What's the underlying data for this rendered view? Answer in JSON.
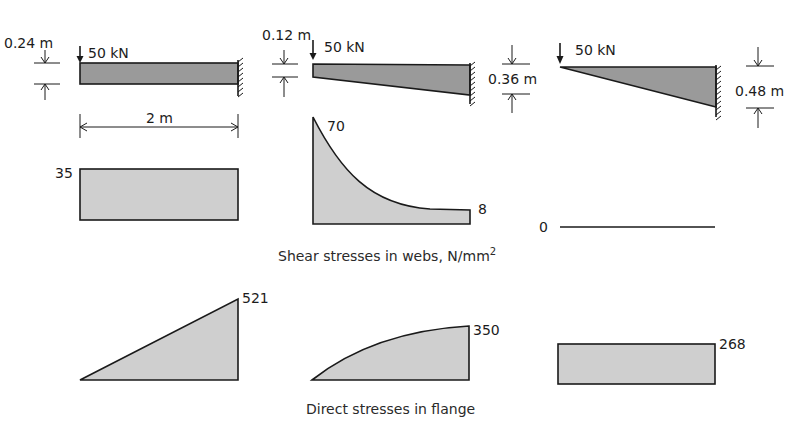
{
  "beams": [
    {
      "id": "uniform",
      "load": "50 kN",
      "depth_tip": "0.24 m",
      "span": "2 m"
    },
    {
      "id": "tapered",
      "load": "50 kN",
      "depth_tip": "0.12 m",
      "depth_root": "0.36 m"
    },
    {
      "id": "wedge",
      "load": "50 kN",
      "depth_root": "0.48 m"
    }
  ],
  "shear": {
    "caption": "Shear stresses in webs, N/mm",
    "caption_sup": "2",
    "values": [
      {
        "label": "35"
      },
      {
        "label_root": "70",
        "label_tip": "8"
      },
      {
        "label": "0"
      }
    ]
  },
  "direct": {
    "caption": "Direct stresses in flange",
    "values": [
      {
        "label": "521"
      },
      {
        "label": "350"
      },
      {
        "label": "268"
      }
    ]
  },
  "colors": {
    "beam_fill": "#9a9a9a",
    "stress_fill": "#cfcfcf",
    "line": "#1a1a1a"
  }
}
